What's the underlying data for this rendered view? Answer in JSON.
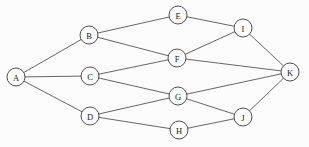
{
  "diagram": {
    "type": "node-link-graph",
    "width": 309,
    "height": 147,
    "background_color": "#fcfcfc",
    "edge_color": "#4a4a4a",
    "node_fill_color": "#fdfdfd",
    "node_stroke_color": "#3c3c3c",
    "label_color": "#1a1a1a",
    "node_radius": 9,
    "nodes": [
      {
        "id": "A",
        "label": "A",
        "x": 16,
        "y": 77
      },
      {
        "id": "B",
        "label": "B",
        "x": 89,
        "y": 35
      },
      {
        "id": "C",
        "label": "C",
        "x": 90,
        "y": 76
      },
      {
        "id": "D",
        "label": "D",
        "x": 90,
        "y": 116
      },
      {
        "id": "E",
        "label": "E",
        "x": 178,
        "y": 15
      },
      {
        "id": "F",
        "label": "F",
        "x": 177,
        "y": 58
      },
      {
        "id": "G",
        "label": "G",
        "x": 178,
        "y": 96
      },
      {
        "id": "H",
        "label": "H",
        "x": 179,
        "y": 130
      },
      {
        "id": "I",
        "label": "I",
        "x": 243,
        "y": 28
      },
      {
        "id": "J",
        "label": "J",
        "x": 243,
        "y": 117
      },
      {
        "id": "K",
        "label": "K",
        "x": 290,
        "y": 72
      }
    ],
    "edges": [
      {
        "from": "A",
        "to": "B"
      },
      {
        "from": "A",
        "to": "C"
      },
      {
        "from": "A",
        "to": "D"
      },
      {
        "from": "B",
        "to": "E"
      },
      {
        "from": "B",
        "to": "F"
      },
      {
        "from": "C",
        "to": "F"
      },
      {
        "from": "C",
        "to": "G"
      },
      {
        "from": "D",
        "to": "G"
      },
      {
        "from": "D",
        "to": "H"
      },
      {
        "from": "E",
        "to": "I"
      },
      {
        "from": "F",
        "to": "I"
      },
      {
        "from": "F",
        "to": "K"
      },
      {
        "from": "G",
        "to": "K"
      },
      {
        "from": "G",
        "to": "J"
      },
      {
        "from": "H",
        "to": "J"
      },
      {
        "from": "I",
        "to": "K"
      },
      {
        "from": "J",
        "to": "K"
      }
    ]
  }
}
